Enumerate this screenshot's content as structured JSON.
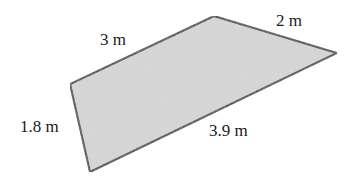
{
  "diagram": {
    "shape": "quadrilateral",
    "fill_color": "#cfcfcf",
    "stroke_color": "#1a1a1a",
    "vertices": [
      [
        70,
        84
      ],
      [
        214,
        16
      ],
      [
        337,
        53
      ],
      [
        90,
        172
      ]
    ],
    "labels": {
      "top_left_side": "3 m",
      "top_right_side": "2 m",
      "left_side": "1.8 m",
      "bottom_side": "3.9 m"
    }
  }
}
